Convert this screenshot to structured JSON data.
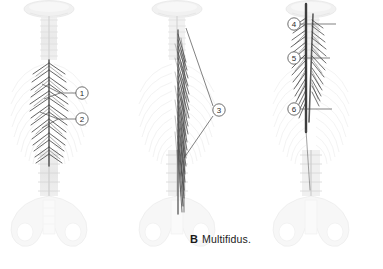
{
  "figure": {
    "background_color": "#ffffff",
    "ink_color": "#4a4a4a",
    "muscle_color": "#3a3a3a",
    "bone_color": "#d8d8d8"
  },
  "panels": [
    {
      "id": "panel-a",
      "letter": "",
      "title": "",
      "caption_visible": false,
      "structure": "posterior vertebral column with skull base, ribs and pelvis; short segmental chevron muscle fascicles shaded dark along the thoracic spine"
    },
    {
      "id": "panel-b",
      "letter": "B",
      "title": "Multifidus.",
      "caption_visible": true,
      "structure": "posterior vertebral column with skull base, ribs and pelvis; long oblique muscle fascicles shaded dark from thoracic to sacral region"
    },
    {
      "id": "panel-c",
      "letter": "C",
      "title": "Semispinalis.",
      "caption_visible": true,
      "structure": "posterior vertebral column with skull base, ribs and pelvis; feathered cervicothoracic muscle fascicles shaded dark"
    }
  ],
  "callouts": [
    {
      "id": "callout-1",
      "number": "1",
      "cx": 82,
      "cy": 93,
      "r": 6.2,
      "panel": "panel-a"
    },
    {
      "id": "callout-2",
      "number": "2",
      "cx": 82,
      "cy": 119,
      "r": 6.2,
      "panel": "panel-a"
    },
    {
      "id": "callout-3",
      "number": "3",
      "cx": 219,
      "cy": 110,
      "r": 6.2,
      "panel": "panel-b"
    },
    {
      "id": "callout-4",
      "number": "4",
      "cx": 294,
      "cy": 24,
      "r": 6.2,
      "panel": "panel-c"
    },
    {
      "id": "callout-5",
      "number": "5",
      "cx": 294,
      "cy": 58,
      "r": 6.2,
      "panel": "panel-c"
    },
    {
      "id": "callout-6",
      "number": "6",
      "cx": 294,
      "cy": 109,
      "r": 6.2,
      "panel": "panel-c"
    }
  ]
}
